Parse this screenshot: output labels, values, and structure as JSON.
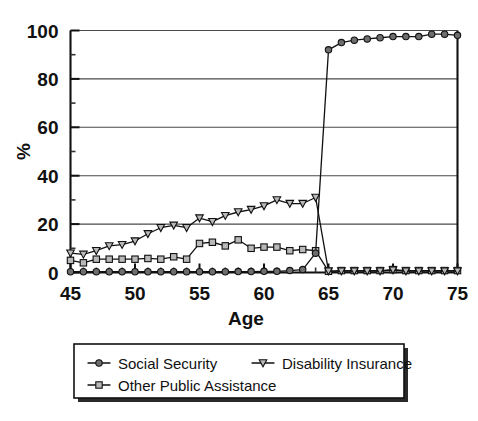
{
  "chart_data": {
    "type": "line",
    "title": "",
    "subtitle": "",
    "xlabel": "Age",
    "ylabel": "%",
    "xlim": [
      45,
      75
    ],
    "ylim": [
      0,
      100
    ],
    "xticks": [
      45,
      50,
      55,
      60,
      65,
      70,
      75
    ],
    "xtick_labels": [
      "45",
      "50",
      "55",
      "60",
      "65",
      "70",
      "75"
    ],
    "yticks": [
      0,
      20,
      40,
      60,
      80,
      100
    ],
    "ytick_labels": [
      "0",
      "20",
      "40",
      "60",
      "80",
      "100"
    ],
    "x_minor_tick_step": 1,
    "y_minor_tick_step": 10,
    "grid": "horizontal",
    "legend_position": "below-axes",
    "x": [
      45,
      46,
      47,
      48,
      49,
      50,
      51,
      52,
      53,
      54,
      55,
      56,
      57,
      58,
      59,
      60,
      61,
      62,
      63,
      64,
      65,
      66,
      67,
      68,
      69,
      70,
      71,
      72,
      73,
      74,
      75
    ],
    "series": [
      {
        "name": "Social Security",
        "marker": "filled-circle",
        "values": [
          0.3,
          0.3,
          0.3,
          0.3,
          0.3,
          0.3,
          0.3,
          0.3,
          0.3,
          0.3,
          0.3,
          0.3,
          0.3,
          0.4,
          0.4,
          0.5,
          0.5,
          0.8,
          1.2,
          8.0,
          92.0,
          95.0,
          96.0,
          96.5,
          97.0,
          97.5,
          97.5,
          97.5,
          98.5,
          98.5,
          98.0
        ]
      },
      {
        "name": "Disability Insurance",
        "marker": "down-triangle",
        "values": [
          8.0,
          7.5,
          9.0,
          11.0,
          11.5,
          13.0,
          16.0,
          18.5,
          19.5,
          18.5,
          22.5,
          21.0,
          23.5,
          25.0,
          26.0,
          27.5,
          30.0,
          28.5,
          28.5,
          31.0,
          0.6,
          0.6,
          0.6,
          0.6,
          0.6,
          1.0,
          0.6,
          0.6,
          0.6,
          0.6,
          0.6
        ]
      },
      {
        "name": "Other Public Assistance",
        "marker": "open-square",
        "values": [
          5.0,
          4.0,
          5.5,
          5.5,
          5.5,
          5.5,
          5.8,
          5.5,
          6.5,
          5.5,
          12.0,
          12.5,
          11.0,
          13.5,
          10.0,
          10.5,
          10.5,
          9.0,
          9.5,
          9.0,
          0.5,
          0.8,
          0.8,
          0.8,
          0.8,
          1.2,
          0.8,
          0.8,
          0.8,
          0.8,
          0.8
        ]
      }
    ],
    "legend": [
      {
        "label": "Social Security",
        "marker": "filled-circle"
      },
      {
        "label": "Disability Insurance",
        "marker": "down-triangle"
      },
      {
        "label": "Other Public Assistance",
        "marker": "open-square"
      }
    ],
    "colors": {
      "axis": "#111111",
      "grid": "#4a4a4a",
      "line": "#111111",
      "marker_fill": "#6e6e6e",
      "marker_open": "#b9b9b9",
      "background": "#ffffff"
    }
  }
}
